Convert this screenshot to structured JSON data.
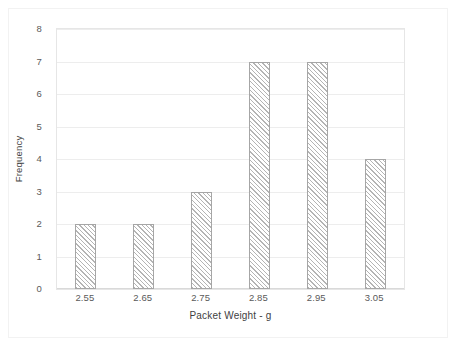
{
  "chart_data": {
    "type": "bar",
    "title": "",
    "subtitle": "",
    "categories": [
      "2.55",
      "2.65",
      "2.75",
      "2.85",
      "2.95",
      "3.05"
    ],
    "values": [
      2,
      2,
      3,
      7,
      7,
      4
    ],
    "xlabel": "Packet Weight - g",
    "ylabel": "Frequency",
    "ylim": [
      0,
      8
    ],
    "y_ticks": [
      "0",
      "1",
      "2",
      "3",
      "4",
      "5",
      "6",
      "7",
      "8"
    ],
    "grid": true,
    "legend": null,
    "legend_position": "none",
    "series": [
      {
        "name": "Frequency",
        "values": [
          2,
          2,
          3,
          7,
          7,
          4
        ]
      }
    ]
  },
  "style": {
    "bar_fill": "#ffffff",
    "bar_hatch_color": "#b4b4b4",
    "bar_border": "#a6a6a6",
    "gridline_color": "#ededed",
    "axis_color": "#d9d9d9",
    "tick_text_color": "#5a5a5a",
    "title_text_color": "#3f3f3f",
    "plot_background": "#ffffff",
    "frame_border": "#f2f2f2"
  }
}
